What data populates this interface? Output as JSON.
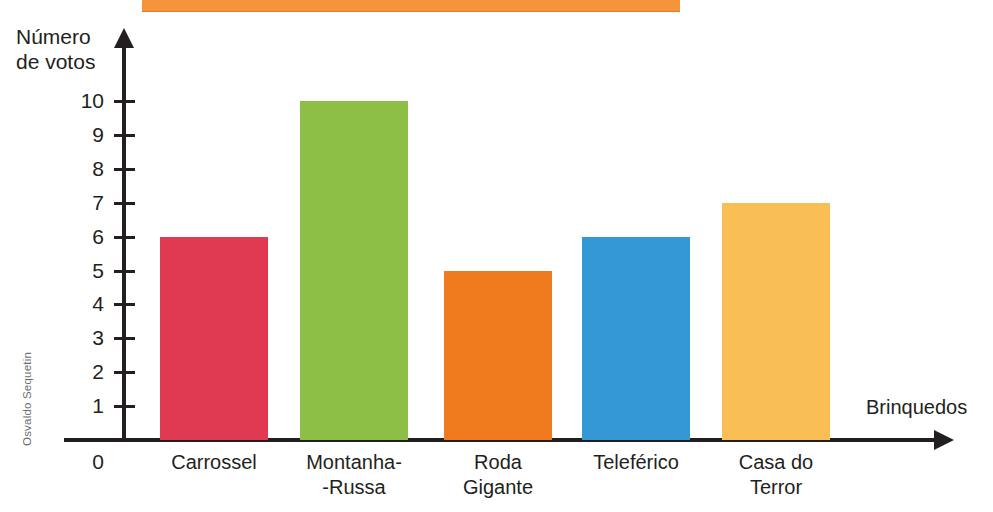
{
  "credit": "Osvaldo Sequetin",
  "banner": {
    "color": "#F6943C"
  },
  "chart_data": {
    "type": "bar",
    "title": "",
    "xlabel": "Brinquedos",
    "ylabel": "Número\nde votos",
    "ylabel_line1": "Número",
    "ylabel_line2": "de votos",
    "categories": [
      "Carrossel",
      "Montanha-\n-Russa",
      "Roda\nGigante",
      "Teleférico",
      "Casa do\nTerror"
    ],
    "category_lines": [
      [
        "Carrossel"
      ],
      [
        "Montanha-",
        "-Russa"
      ],
      [
        "Roda",
        "Gigante"
      ],
      [
        "Teleférico"
      ],
      [
        "Casa do",
        "Terror"
      ]
    ],
    "values": [
      6,
      10,
      5,
      6,
      7
    ],
    "colors": [
      "#E03A52",
      "#8DBE45",
      "#F07B1E",
      "#3498D4",
      "#F9BE54"
    ],
    "ylim": [
      0,
      10
    ],
    "ytick_labels": [
      "10",
      "9",
      "8",
      "7",
      "6",
      "5",
      "4",
      "3",
      "2",
      "1",
      "0"
    ],
    "ytick_values": [
      10,
      9,
      8,
      7,
      6,
      5,
      4,
      3,
      2,
      1,
      0
    ],
    "grid": false,
    "legend": "none"
  }
}
